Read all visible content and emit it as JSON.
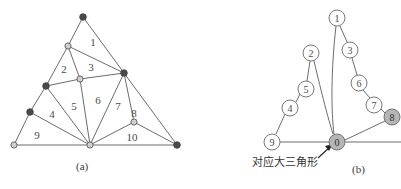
{
  "figure": {
    "panels": [
      {
        "id": "a",
        "caption": "(a)",
        "type": "triangulated-polygon-mesh",
        "face_labels": [
          "1",
          "2",
          "3",
          "4",
          "5",
          "6",
          "7",
          "8",
          "9",
          "10"
        ],
        "vertices": [
          {
            "id": "apex",
            "x": 83,
            "y": 17,
            "fill": "dark"
          },
          {
            "id": "upper-left",
            "x": 68,
            "y": 46,
            "fill": "light"
          },
          {
            "id": "right-mid",
            "x": 124,
            "y": 73,
            "fill": "dark"
          },
          {
            "id": "interior-top",
            "x": 80,
            "y": 79,
            "fill": "light"
          },
          {
            "id": "left-upper",
            "x": 46,
            "y": 86,
            "fill": "dark"
          },
          {
            "id": "left-lower",
            "x": 30,
            "y": 112,
            "fill": "dark"
          },
          {
            "id": "bottom-left",
            "x": 14,
            "y": 145,
            "fill": "light"
          },
          {
            "id": "bottom-mid",
            "x": 90,
            "y": 145,
            "fill": "light"
          },
          {
            "id": "right-low",
            "x": 134,
            "y": 122,
            "fill": "light"
          },
          {
            "id": "bottom-right",
            "x": 177,
            "y": 145,
            "fill": "dark"
          }
        ],
        "edges": [
          [
            "apex",
            "upper-left"
          ],
          [
            "apex",
            "right-mid"
          ],
          [
            "upper-left",
            "right-mid"
          ],
          [
            "upper-left",
            "interior-top"
          ],
          [
            "upper-left",
            "left-upper"
          ],
          [
            "interior-top",
            "right-mid"
          ],
          [
            "interior-top",
            "left-upper"
          ],
          [
            "interior-top",
            "bottom-mid"
          ],
          [
            "left-upper",
            "left-lower"
          ],
          [
            "left-upper",
            "bottom-mid"
          ],
          [
            "left-lower",
            "bottom-left"
          ],
          [
            "left-lower",
            "bottom-mid"
          ],
          [
            "bottom-left",
            "bottom-mid"
          ],
          [
            "bottom-mid",
            "right-mid"
          ],
          [
            "bottom-mid",
            "right-low"
          ],
          [
            "bottom-mid",
            "bottom-right"
          ],
          [
            "right-mid",
            "right-low"
          ],
          [
            "right-mid",
            "bottom-right"
          ],
          [
            "right-low",
            "bottom-right"
          ]
        ],
        "label_positions": [
          {
            "text": "1",
            "x": 93,
            "y": 46
          },
          {
            "text": "2",
            "x": 64,
            "y": 73
          },
          {
            "text": "3",
            "x": 91,
            "y": 71
          },
          {
            "text": "4",
            "x": 52,
            "y": 118
          },
          {
            "text": "5",
            "x": 74,
            "y": 110
          },
          {
            "text": "6",
            "x": 98,
            "y": 104
          },
          {
            "text": "7",
            "x": 118,
            "y": 110
          },
          {
            "text": "8",
            "x": 133,
            "y": 117
          },
          {
            "text": "9",
            "x": 37,
            "y": 139
          },
          {
            "text": "10",
            "x": 132,
            "y": 141
          }
        ]
      },
      {
        "id": "b",
        "caption": "(b)",
        "type": "dual-graph-tree",
        "annotation": "对应大三角形",
        "nodes": [
          {
            "label": "1",
            "x": 337,
            "y": 18,
            "fill": "light"
          },
          {
            "label": "2",
            "x": 311,
            "y": 53,
            "fill": "light"
          },
          {
            "label": "3",
            "x": 350,
            "y": 50,
            "fill": "light"
          },
          {
            "label": "5",
            "x": 306,
            "y": 89,
            "fill": "light"
          },
          {
            "label": "6",
            "x": 359,
            "y": 83,
            "fill": "light"
          },
          {
            "label": "4",
            "x": 290,
            "y": 108,
            "fill": "light"
          },
          {
            "label": "7",
            "x": 374,
            "y": 105,
            "fill": "light"
          },
          {
            "label": "8",
            "x": 392,
            "y": 117,
            "fill": "shaded"
          },
          {
            "label": "9",
            "x": 272,
            "y": 142,
            "fill": "light"
          },
          {
            "label": "0",
            "x": 337,
            "y": 142,
            "fill": "shaded"
          }
        ],
        "links": [
          [
            "1",
            "3"
          ],
          [
            "3",
            "6"
          ],
          [
            "6",
            "7"
          ],
          [
            "7",
            "8"
          ],
          [
            "8",
            "0"
          ],
          [
            "2",
            "5"
          ],
          [
            "5",
            "4"
          ],
          [
            "4",
            "9"
          ],
          [
            "9",
            "0"
          ],
          [
            "1",
            "0"
          ],
          [
            "2",
            "0"
          ]
        ]
      }
    ]
  },
  "colors": {
    "stroke": "#5a5a5a",
    "node_dark": "#4a4a4a",
    "node_light": "#cfcfcf",
    "node_shaded": "#b5b5b5",
    "label_text": "#4a4a4a",
    "caption_text": "#3a3a3a",
    "background": "#ffffff"
  }
}
